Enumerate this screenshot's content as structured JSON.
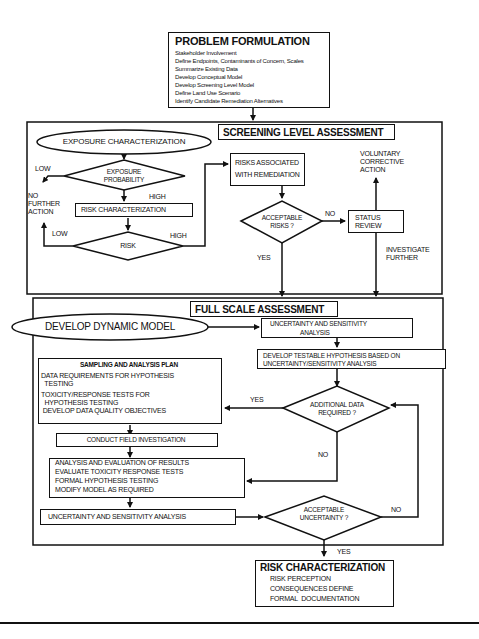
{
  "problem_formulation": {
    "title": "PROBLEM FORMULATION",
    "items": [
      "Stakeholder Involvement",
      "Define Endpoints, Contaminants of Concern, Scales",
      "Summarize Existing Data",
      "Develop Conceptual Model",
      "Develop Screening Level Model",
      "Define Land Use Scenario",
      "Identify Candidate Remediation Alternatives"
    ]
  },
  "screening": {
    "title": "SCREENING LEVEL ASSESSMENT",
    "exposure_characterization": "EXPOSURE CHARACTERIZATION",
    "exposure_probability_line1": "EXPOSURE",
    "exposure_probability_line2": "PROBABILITY",
    "low_top": "LOW",
    "high_top": "HIGH",
    "no_further_action": [
      "NO",
      "FURTHER",
      "ACTION"
    ],
    "risk_characterization": "RISK CHARACTERIZATION",
    "risk": "RISK",
    "low_bottom": "LOW",
    "high_bottom": "HIGH",
    "risks_remediation_line1": "RISKS ASSOCIATED",
    "risks_remediation_line2": "WITH REMEDIATION",
    "acceptable_risks_line1": "ACCEPTABLE",
    "acceptable_risks_line2": "RISKS ?",
    "no": "NO",
    "yes": "YES",
    "status_review_line1": "STATUS",
    "status_review_line2": "REVIEW",
    "voluntary": [
      "VOLUNTARY",
      "CORRECTIVE",
      "ACTION"
    ],
    "investigate": [
      "INVESTIGATE",
      "FURTHER"
    ]
  },
  "full_scale": {
    "title": "FULL SCALE ASSESSMENT",
    "develop_dynamic_model": "DEVELOP DYNAMIC MODEL",
    "uncertainty_top_line1": "UNCERTAINTY AND SENSITIVITY",
    "uncertainty_top_line2": "ANALYSIS",
    "testable_line1": "DEVELOP TESTABLE HYPOTHESIS BASED ON",
    "testable_line2": "UNCERTAINTY/SENSITIVITY ANALYSIS",
    "sampling": {
      "title": "SAMPLING AND ANALYSIS PLAN",
      "items": [
        "DATA REQUIREMENTS FOR HYPOTHESIS",
        "  TESTING",
        "TOXICITY/RESPONSE TESTS FOR",
        "  HYPOTHESIS TESTING",
        " DEVELOP DATA QUALITY OBJECTIVES"
      ]
    },
    "additional_data_line1": "ADDITIONAL DATA",
    "additional_data_line2": "REQUIRED ?",
    "yes": "YES",
    "no_mid": "NO",
    "conduct_field": "CONDUCT FIELD INVESTIGATION",
    "analysis": [
      "ANALYSIS AND EVALUATION OF RESULTS",
      "EVALUATE TOXICITY RESPONSE TESTS",
      "FORMAL HYPOTHESIS TESTING",
      "MODIFY MODEL AS REQUIRED"
    ],
    "uncertainty_bottom": "UNCERTAINTY AND SENSITIVITY ANALYSIS",
    "acceptable_unc_line1": "ACCEPTABLE",
    "acceptable_unc_line2": "UNCERTAINTY ?",
    "no_right": "NO"
  },
  "risk_characterization": {
    "yes": "YES",
    "title": "RISK CHARACTERIZATION",
    "items": [
      "RISK PERCEPTION",
      "CONSEQUENCES DEFINE",
      "FORMAL  DOCUMENTATION"
    ]
  }
}
